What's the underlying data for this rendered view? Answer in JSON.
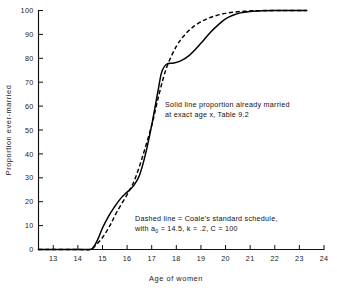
{
  "chart_data": {
    "type": "line",
    "title": "",
    "xlabel": "Age of women",
    "ylabel": "Proportion ever-married",
    "xlim": [
      12.4,
      24
    ],
    "ylim": [
      0,
      100
    ],
    "xticks": [
      13,
      14,
      15,
      16,
      17,
      18,
      19,
      20,
      21,
      22,
      23,
      24
    ],
    "yticks": [
      0,
      10,
      20,
      30,
      40,
      50,
      60,
      70,
      80,
      90,
      100
    ],
    "grid": false,
    "legend_position": "inline-annotation",
    "series": [
      {
        "name": "Solid line proportion already married at exact age x, Table 9.2",
        "style": "solid",
        "x": [
          12.4,
          13.0,
          14.0,
          14.4,
          14.6,
          14.8,
          15.0,
          15.25,
          15.5,
          15.75,
          16.0,
          16.25,
          16.5,
          16.75,
          17.0,
          17.25,
          17.4,
          17.6,
          17.9,
          18.2,
          18.5,
          18.8,
          19.1,
          19.4,
          19.7,
          20.0,
          20.3,
          20.6,
          21.0,
          21.5,
          22.0,
          22.5,
          23.0,
          23.3
        ],
        "y": [
          0,
          0,
          0,
          0,
          0.5,
          4,
          9,
          14,
          18,
          21.5,
          24,
          26.5,
          31,
          40,
          52,
          66,
          74,
          77.5,
          78,
          79,
          81,
          84,
          87.5,
          91,
          94,
          96.5,
          98,
          99,
          99.6,
          99.9,
          100,
          100,
          100,
          100
        ]
      },
      {
        "name": "Dashed line = Coale's standard schedule, with a0 = 14.5, k = .2, C = 100",
        "style": "dashed",
        "x": [
          12.4,
          13.0,
          14.0,
          14.5,
          14.7,
          15.0,
          15.3,
          15.6,
          16.0,
          16.3,
          16.6,
          17.0,
          17.3,
          17.6,
          18.0,
          18.4,
          18.8,
          19.2,
          19.6,
          20.0,
          20.4,
          20.8,
          21.2,
          21.8,
          22.4,
          23.0,
          23.3
        ],
        "y": [
          0,
          0,
          0,
          0,
          1.5,
          5,
          10,
          16,
          23,
          29,
          38,
          52,
          65,
          76,
          85,
          90.5,
          94,
          96.3,
          97.8,
          98.8,
          99.4,
          99.7,
          99.9,
          100,
          100,
          100,
          100
        ]
      }
    ],
    "annotations": [
      {
        "id": "solid-note",
        "lines": [
          "Solid line proportion already married",
          "at exact age x, Table 9.2"
        ],
        "x": 165,
        "y": 107
      },
      {
        "id": "dashed-note",
        "line1": "Dashed line = Coale's standard schedule,",
        "line2_pre": "with a",
        "line2_sub": "0",
        "line2_post": " = 14.5, k = .2, C = 100",
        "x": 135,
        "y": 221
      }
    ]
  },
  "axes": {
    "x_title": "Age of women",
    "y_title": "Proportion ever-married",
    "x_tick_labels": [
      "13",
      "14",
      "15",
      "16",
      "17",
      "18",
      "19",
      "20",
      "21",
      "22",
      "23",
      "24"
    ],
    "y_tick_labels": [
      "0",
      "10",
      "20",
      "30",
      "40",
      "50",
      "60",
      "70",
      "80",
      "90",
      "100"
    ]
  },
  "colors": {
    "ink": "#000000",
    "paper": "#ffffff"
  }
}
